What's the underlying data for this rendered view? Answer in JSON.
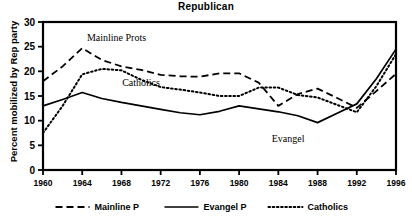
{
  "chart_data": {
    "type": "line",
    "title": "Republican",
    "xlabel": "",
    "ylabel": "Percent mobilized by Rep party",
    "xlim": [
      1960,
      1996
    ],
    "ylim": [
      0,
      30
    ],
    "ytick_step": 5,
    "yticks": [
      "0",
      "5",
      "10",
      "15",
      "20",
      "25",
      "30"
    ],
    "xticks": [
      "1960",
      "1964",
      "1968",
      "1972",
      "1976",
      "1980",
      "1984",
      "1988",
      "1992",
      "1996"
    ],
    "x": [
      1960,
      1962,
      1964,
      1966,
      1968,
      1970,
      1972,
      1974,
      1976,
      1978,
      1980,
      1982,
      1984,
      1986,
      1988,
      1990,
      1992,
      1994,
      1996
    ],
    "grid": false,
    "legend_position": "bottom",
    "series": [
      {
        "name": "Mainline P",
        "style": "dashed",
        "color": "#000000",
        "values": [
          18.0,
          21.0,
          24.7,
          22.3,
          21.0,
          20.3,
          19.3,
          19.0,
          18.9,
          19.6,
          19.6,
          17.7,
          13.0,
          15.4,
          16.5,
          14.6,
          12.6,
          16.0,
          19.5
        ]
      },
      {
        "name": "Evangel P",
        "style": "solid",
        "color": "#000000",
        "values": [
          13.0,
          14.3,
          15.7,
          14.5,
          13.7,
          13.0,
          12.3,
          11.6,
          11.2,
          11.9,
          13.0,
          12.4,
          11.8,
          11.0,
          9.6,
          11.5,
          13.4,
          18.5,
          24.5
        ]
      },
      {
        "name": "Catholics",
        "style": "dotted",
        "color": "#000000",
        "values": [
          7.5,
          13.0,
          19.4,
          20.5,
          20.2,
          18.3,
          16.8,
          16.3,
          15.7,
          15.0,
          15.0,
          16.7,
          16.7,
          15.2,
          14.7,
          13.2,
          11.7,
          17.0,
          23.5
        ]
      }
    ],
    "annotations": [
      {
        "text": "Mainline Prots",
        "x": 1967.5,
        "y": 26.2
      },
      {
        "text": "Catholics",
        "x": 1970.0,
        "y": 17.0
      },
      {
        "text": "Evangel",
        "x": 1985.0,
        "y": 5.6
      }
    ],
    "legend": [
      {
        "label": "Mainline P",
        "style": "dashed"
      },
      {
        "label": "Evangel P",
        "style": "solid"
      },
      {
        "label": "Catholics",
        "style": "dotted"
      }
    ]
  }
}
